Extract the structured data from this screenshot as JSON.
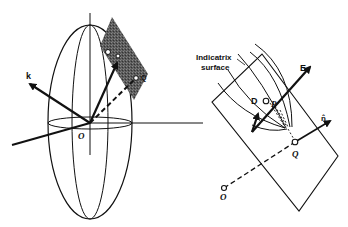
{
  "figure": {
    "left_panel": {
      "description": "Index ellipsoid with tangent plane at point P",
      "labels": {
        "k": "k",
        "origin": "O",
        "point_d": "D",
        "point_p": "P",
        "point_q": "Q"
      }
    },
    "right_panel": {
      "description": "Enlarged view of tangent plane with indicatrix surface",
      "labels": {
        "indicatrix_line1": "Indicatrix",
        "indicatrix_line2": "surface",
        "E": "E",
        "D": "D",
        "P": "P",
        "n": "n̂",
        "Q": "Q",
        "O": "O"
      }
    },
    "colors": {
      "ink": "#111111",
      "shaded_plane": "#555555",
      "background": "#ffffff"
    }
  }
}
